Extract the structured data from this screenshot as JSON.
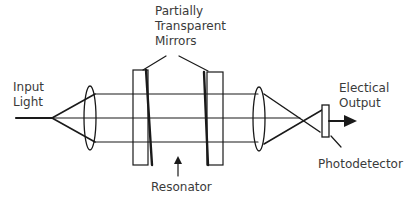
{
  "diagram": {
    "type": "optical-resonator-schematic",
    "labels": {
      "mirrors_line1": "Partially",
      "mirrors_line2": "Transparent",
      "mirrors_line3": "Mirrors",
      "input_line1": "Input",
      "input_line2": "Light",
      "output_line1": "Electical",
      "output_line2": "Output",
      "photodetector": "Photodetector",
      "resonator": "Resonator"
    },
    "components": [
      {
        "id": "input-beam",
        "kind": "line"
      },
      {
        "id": "input-lens",
        "kind": "lens"
      },
      {
        "id": "left-mirror",
        "kind": "partially-transparent-mirror"
      },
      {
        "id": "right-mirror",
        "kind": "partially-transparent-mirror"
      },
      {
        "id": "output-lens",
        "kind": "lens"
      },
      {
        "id": "photodetector",
        "kind": "detector"
      },
      {
        "id": "output-arrow",
        "kind": "arrow"
      }
    ],
    "colors": {
      "stroke": "#1a1a1a",
      "text": "#3a3a3a",
      "background": "#ffffff"
    }
  }
}
